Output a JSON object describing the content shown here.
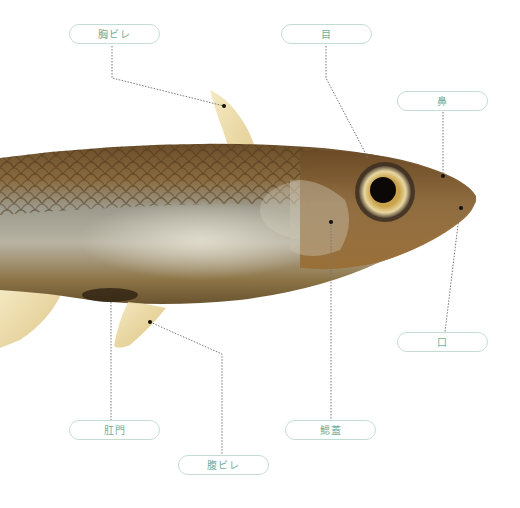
{
  "diagram": {
    "accent_color": "#6fae98",
    "label_border_color": "#c5dcd3",
    "leader_line_color": "#777777",
    "labels": [
      {
        "id": "pectoral-fin",
        "text": "胸ビレ"
      },
      {
        "id": "eye",
        "text": "目"
      },
      {
        "id": "nostril",
        "text": "鼻"
      },
      {
        "id": "mouth",
        "text": "口"
      },
      {
        "id": "anus",
        "text": "肛門"
      },
      {
        "id": "gill-cover",
        "text": "鰓蓋"
      },
      {
        "id": "pelvic-fin",
        "text": "腹ビレ"
      }
    ]
  }
}
